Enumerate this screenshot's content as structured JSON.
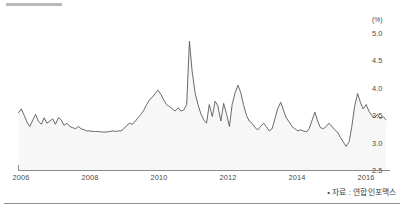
{
  "chart_data": {
    "type": "line",
    "title": "",
    "subtitle": "",
    "xlabel": "",
    "ylabel": "",
    "yunit": "(%)",
    "ylim": [
      2.5,
      5.0
    ],
    "xlim": [
      2006.0,
      2016.75
    ],
    "grid": false,
    "legend": null,
    "fill": true,
    "y_ticks": [
      "5.0",
      "4.5",
      "4.0",
      "3.5",
      "3.0",
      "2.5"
    ],
    "y_tick_values": [
      5.0,
      4.5,
      4.0,
      3.5,
      3.0,
      2.5
    ],
    "x_ticks": [
      "2006",
      "2008",
      "2010",
      "2012",
      "2014",
      "2016"
    ],
    "x_tick_values": [
      2006,
      2008,
      2010,
      2012,
      2014,
      2016
    ],
    "series": [
      {
        "name": "",
        "x": [
          2006.0,
          2006.08,
          2006.17,
          2006.25,
          2006.33,
          2006.42,
          2006.5,
          2006.58,
          2006.67,
          2006.75,
          2006.83,
          2006.92,
          2007.0,
          2007.08,
          2007.17,
          2007.25,
          2007.33,
          2007.42,
          2007.5,
          2007.58,
          2007.67,
          2007.75,
          2007.83,
          2007.92,
          2008.0,
          2008.08,
          2008.17,
          2008.25,
          2008.33,
          2008.42,
          2008.5,
          2008.58,
          2008.67,
          2008.75,
          2008.83,
          2008.92,
          2009.0,
          2009.08,
          2009.17,
          2009.25,
          2009.33,
          2009.42,
          2009.5,
          2009.58,
          2009.67,
          2009.75,
          2009.83,
          2009.92,
          2010.0,
          2010.08,
          2010.17,
          2010.25,
          2010.33,
          2010.42,
          2010.5,
          2010.58,
          2010.67,
          2010.75,
          2010.83,
          2010.92,
          2011.0,
          2011.08,
          2011.17,
          2011.25,
          2011.33,
          2011.42,
          2011.5,
          2011.58,
          2011.67,
          2011.75,
          2011.83,
          2011.92,
          2012.0,
          2012.08,
          2012.17,
          2012.25,
          2012.33,
          2012.42,
          2012.5,
          2012.58,
          2012.67,
          2012.75,
          2012.83,
          2012.92,
          2013.0,
          2013.08,
          2013.17,
          2013.25,
          2013.33,
          2013.42,
          2013.5,
          2013.58,
          2013.67,
          2013.75,
          2013.83,
          2013.92,
          2014.0,
          2014.08,
          2014.17,
          2014.25,
          2014.33,
          2014.42,
          2014.5,
          2014.58,
          2014.67,
          2014.75,
          2014.83,
          2014.92,
          2015.0,
          2015.08,
          2015.17,
          2015.25,
          2015.33,
          2015.42,
          2015.5,
          2015.58,
          2015.67,
          2015.75,
          2015.83,
          2015.92,
          2016.0,
          2016.08,
          2016.17,
          2016.25,
          2016.33,
          2016.42,
          2016.5,
          2016.58,
          2016.67,
          2016.75
        ],
        "values": [
          3.55,
          3.62,
          3.5,
          3.38,
          3.3,
          3.42,
          3.52,
          3.4,
          3.34,
          3.46,
          3.36,
          3.4,
          3.44,
          3.34,
          3.46,
          3.42,
          3.32,
          3.36,
          3.3,
          3.28,
          3.26,
          3.3,
          3.26,
          3.24,
          3.22,
          3.22,
          3.21,
          3.21,
          3.21,
          3.2,
          3.2,
          3.2,
          3.21,
          3.22,
          3.21,
          3.22,
          3.22,
          3.26,
          3.32,
          3.36,
          3.34,
          3.4,
          3.46,
          3.52,
          3.6,
          3.7,
          3.78,
          3.84,
          3.9,
          3.96,
          3.88,
          3.78,
          3.7,
          3.66,
          3.62,
          3.58,
          3.64,
          3.58,
          3.6,
          3.7,
          4.85,
          4.3,
          3.9,
          3.7,
          3.54,
          3.42,
          3.36,
          3.7,
          3.48,
          3.76,
          3.68,
          3.4,
          3.72,
          3.54,
          3.3,
          3.7,
          3.9,
          4.05,
          3.92,
          3.7,
          3.5,
          3.4,
          3.36,
          3.28,
          3.24,
          3.3,
          3.36,
          3.3,
          3.22,
          3.26,
          3.44,
          3.62,
          3.74,
          3.6,
          3.46,
          3.38,
          3.3,
          3.26,
          3.22,
          3.24,
          3.22,
          3.2,
          3.26,
          3.4,
          3.56,
          3.4,
          3.28,
          3.26,
          3.3,
          3.36,
          3.3,
          3.24,
          3.2,
          3.1,
          3.02,
          2.94,
          3.02,
          3.3,
          3.66,
          3.9,
          3.74,
          3.62,
          3.7,
          3.58,
          3.5,
          3.46,
          3.52,
          3.44,
          3.48,
          3.42
        ]
      }
    ],
    "annotations": [],
    "source_note": "• 자료 : 연합인포맥스",
    "colors": {
      "line": "#595959",
      "fill": "#f7f7f7",
      "axis": "#8c8c8c",
      "text": "#4a4a4a"
    }
  }
}
